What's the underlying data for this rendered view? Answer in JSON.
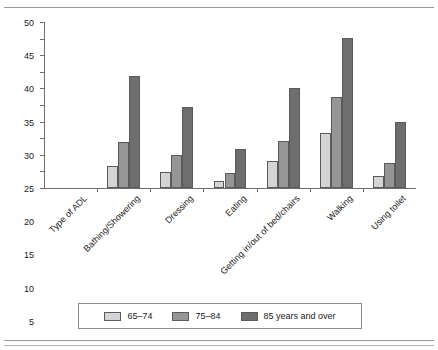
{
  "chart_data": {
    "type": "bar",
    "title": "",
    "xlabel": "Type of ADL",
    "ylabel": "",
    "ylim": [
      0,
      50
    ],
    "yticks": [
      0,
      5,
      10,
      15,
      20,
      25,
      30,
      35,
      40,
      45,
      50
    ],
    "grid": false,
    "legend_position": "bottom",
    "categories": [
      "Type of ADL",
      "Bathing/Showering",
      "Dressing",
      "Eating",
      "Getting in/out of bed/chairs",
      "Walking",
      "Using toilet"
    ],
    "series": [
      {
        "name": "65–74",
        "color": "#d4d4d4",
        "values": [
          null,
          6.6,
          4.7,
          2.2,
          8.2,
          16.5,
          3.7
        ]
      },
      {
        "name": "75–84",
        "color": "#969696",
        "values": [
          null,
          13.8,
          9.9,
          4.6,
          14.1,
          27.5,
          7.5
        ]
      },
      {
        "name": "85 years and over",
        "color": "#6e6e6e",
        "values": [
          null,
          33.8,
          24.3,
          11.9,
          30.1,
          45.2,
          20.0
        ]
      }
    ]
  },
  "legend": {
    "items": [
      {
        "label": "65–74",
        "swatch": "light-gray-swatch"
      },
      {
        "label": "75–84",
        "swatch": "medium-gray-swatch"
      },
      {
        "label": "85 years and over",
        "swatch": "dark-gray-swatch"
      }
    ]
  },
  "colors": {
    "series_65_74": "#d4d4d4",
    "series_75_84": "#969696",
    "series_85_over": "#6e6e6e",
    "axis": "#6e6e6e",
    "text": "#1a1a1a",
    "background": "#ffffff"
  }
}
